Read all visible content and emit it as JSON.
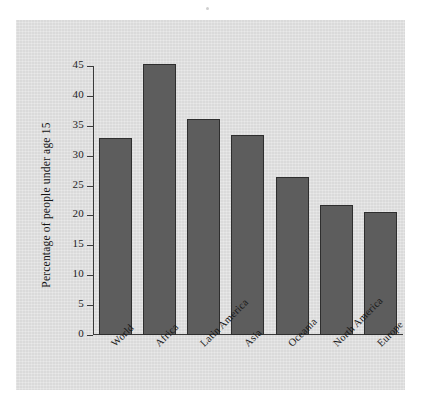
{
  "chart_data": {
    "type": "bar",
    "title": "",
    "xlabel": "",
    "ylabel": "Percentage of people under age 15",
    "categories": [
      "World",
      "Africa",
      "Latin America",
      "Asia",
      "Oceania",
      "North America",
      "Europe"
    ],
    "values": [
      33.0,
      45.3,
      36.2,
      33.4,
      26.4,
      21.7,
      20.5
    ],
    "ylim": [
      0,
      45
    ],
    "yticks": [
      0,
      5,
      10,
      15,
      20,
      25,
      30,
      35,
      40,
      45
    ],
    "ytick_labels": [
      "0",
      "5",
      "10",
      "15",
      "20",
      "25",
      "30",
      "35",
      "40",
      "45"
    ],
    "grid": false,
    "legend": null,
    "bar_color": "#5d5d5d",
    "bar_edge_color": "#2e2e2e",
    "panel_color": "#e0e0e0",
    "axis_color": "#3a3a3a",
    "tick_label_rotation": -45
  }
}
